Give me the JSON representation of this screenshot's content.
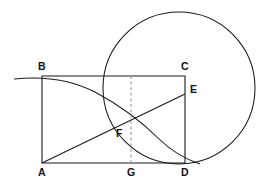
{
  "figure": {
    "kind": "geometry-diagram",
    "width": 268,
    "height": 187,
    "background_color": "#ffffff",
    "line_color": "#1a1a1a",
    "dashed_color": "#9a9a9a"
  },
  "points": [
    {
      "id": "A",
      "label": "A",
      "x": 42,
      "y": 163,
      "label_x": 38,
      "label_y": 176,
      "role": "rectangle-corner-bottom-left"
    },
    {
      "id": "B",
      "label": "B",
      "x": 42,
      "y": 76,
      "label_x": 38,
      "label_y": 70,
      "role": "rectangle-corner-top-left"
    },
    {
      "id": "C",
      "label": "C",
      "x": 185,
      "y": 76,
      "label_x": 181,
      "label_y": 70,
      "role": "rectangle-corner-top-right"
    },
    {
      "id": "D",
      "label": "D",
      "x": 185,
      "y": 163,
      "label_x": 181,
      "label_y": 176,
      "role": "rectangle-corner-bottom-right"
    },
    {
      "id": "E",
      "label": "E",
      "x": 185,
      "y": 94,
      "label_x": 190,
      "label_y": 93,
      "role": "point-on-side-CD"
    },
    {
      "id": "F",
      "label": "F",
      "x": 123,
      "y": 128,
      "label_x": 116,
      "label_y": 137,
      "role": "intersection-point"
    },
    {
      "id": "G",
      "label": "G",
      "x": 131,
      "y": 163,
      "label_x": 127,
      "label_y": 176,
      "role": "foot-on-side-AD"
    }
  ],
  "segments": [
    {
      "id": "AB",
      "from": "A",
      "to": "B",
      "name": "side-AB",
      "style": "solid"
    },
    {
      "id": "BC",
      "from": "B",
      "to": "C",
      "name": "side-BC",
      "style": "solid"
    },
    {
      "id": "CD",
      "from": "C",
      "to": "D",
      "name": "side-CD",
      "style": "solid"
    },
    {
      "id": "DA",
      "from": "D",
      "to": "A",
      "name": "side-DA",
      "style": "solid"
    },
    {
      "id": "AE",
      "from": "A",
      "to": "E",
      "name": "diagonal-AE",
      "style": "solid"
    },
    {
      "id": "FG",
      "from": "F",
      "to": "G",
      "name": "dashed-FG",
      "style": "dashed"
    }
  ],
  "dashed_line": {
    "name": "dashed-vertical-through-F",
    "x": 131,
    "y_top": 76,
    "y_bottom": 164
  },
  "circle": {
    "name": "large-circle",
    "center_x": 179,
    "center_y": 88,
    "radius": 76,
    "tangent_to": "side-DA"
  },
  "arc": {
    "name": "arc-from-B-to-D",
    "start_x": 14,
    "start_y": 79,
    "end_x": 200,
    "end_y": 164,
    "through_x": 95,
    "through_y": 90,
    "description": "Curve passing through B, descending through F and meeting DA tangentially near D"
  },
  "labels": {
    "A": "A",
    "B": "B",
    "C": "C",
    "D": "D",
    "E": "E",
    "F": "F",
    "G": "G"
  }
}
